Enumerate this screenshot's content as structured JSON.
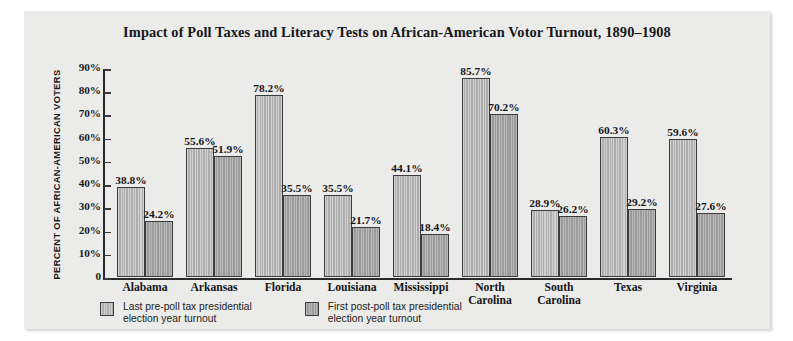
{
  "chart_data": {
    "type": "bar",
    "title": "Impact of Poll Taxes and Literacy Tests on African-American Votor Turnout, 1890–1908",
    "xlabel": "",
    "ylabel": "PERCENT OF AFRICAN-AMERICAN VOTERS",
    "ylim": [
      0,
      90
    ],
    "ytick_labels": [
      "90%",
      "80%",
      "70%",
      "60%",
      "50%",
      "40%",
      "30%",
      "20%",
      "10%",
      "0"
    ],
    "ytick_values": [
      90,
      80,
      70,
      60,
      50,
      40,
      30,
      20,
      10,
      0
    ],
    "grid": false,
    "legend_position": "bottom-left",
    "categories": [
      "Alabama",
      "Arkansas",
      "Florida",
      "Louisiana",
      "Mississippi",
      "North\nCarolina",
      "South\nCarolina",
      "Texas",
      "Virginia"
    ],
    "series": [
      {
        "name": "Last pre-poll tax presidential\nelection year turnout",
        "color": "#adadad",
        "values": [
          38.8,
          55.6,
          78.2,
          35.5,
          44.1,
          85.7,
          28.9,
          60.3,
          59.6
        ],
        "value_labels": [
          "38.8%",
          "55.6%",
          "78.2%",
          "35.5%",
          "44.1%",
          "85.7%",
          "28.9%",
          "60.3%",
          "59.6%"
        ]
      },
      {
        "name": "First post-poll tax presidential\nelection year turnout",
        "color": "#9b9b9b",
        "values": [
          24.2,
          51.9,
          35.5,
          21.7,
          18.4,
          70.2,
          26.2,
          29.2,
          27.6
        ],
        "value_labels": [
          "24.2%",
          "51.9%",
          "35.5%",
          "21.7%",
          "18.4%",
          "70.2%",
          "26.2%",
          "29.2%",
          "27.6%"
        ]
      }
    ]
  },
  "legend": [
    {
      "label": "Last pre-poll tax presidential\nelection year turnout",
      "swatch": "pre"
    },
    {
      "label": "First post-poll tax presidential\nelection year turnout",
      "swatch": "post"
    }
  ],
  "colors": {
    "panel_background": "#ebebe9",
    "page_background": "#ffffff",
    "axis": "#2a2a2c",
    "bar_pre": "#adadad",
    "bar_post": "#9b9b9b",
    "text": "#141416"
  }
}
